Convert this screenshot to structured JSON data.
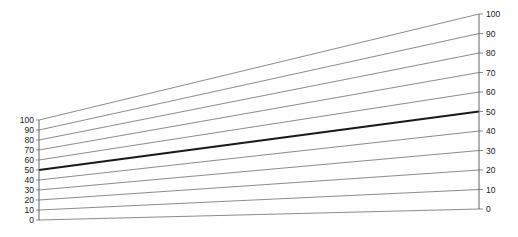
{
  "chart_data": {
    "type": "line",
    "title": "",
    "subtitle": "",
    "xlabel": "",
    "ylabel": "",
    "grid": false,
    "legend": null,
    "axes": [
      {
        "name": "left-scale",
        "position": "left",
        "range": [
          0,
          100
        ],
        "tick_step": 10,
        "tick_labels": [
          "100",
          "90",
          "80",
          "70",
          "60",
          "50",
          "40",
          "30",
          "20",
          "10",
          "0"
        ],
        "tick_values": [
          100,
          90,
          80,
          70,
          60,
          50,
          40,
          30,
          20,
          10,
          0
        ],
        "pixel_top": 120,
        "pixel_bottom": 220,
        "pixel_x": 39
      },
      {
        "name": "right-scale",
        "position": "right",
        "range": [
          0,
          100
        ],
        "tick_step": 10,
        "tick_labels": [
          "100",
          "90",
          "80",
          "70",
          "60",
          "50",
          "40",
          "30",
          "20",
          "10",
          "0"
        ],
        "tick_values": [
          100,
          90,
          80,
          70,
          60,
          50,
          40,
          30,
          20,
          10,
          0
        ],
        "pixel_top": 14,
        "pixel_bottom": 209,
        "pixel_x": 479
      }
    ],
    "series": [
      {
        "name": "tie-100",
        "value": 100,
        "left_value": 100,
        "right_value": 100,
        "emphasis": false
      },
      {
        "name": "tie-90",
        "value": 90,
        "left_value": 90,
        "right_value": 90,
        "emphasis": false
      },
      {
        "name": "tie-80",
        "value": 80,
        "left_value": 80,
        "right_value": 80,
        "emphasis": false
      },
      {
        "name": "tie-70",
        "value": 70,
        "left_value": 70,
        "right_value": 70,
        "emphasis": false
      },
      {
        "name": "tie-60",
        "value": 60,
        "left_value": 60,
        "right_value": 60,
        "emphasis": false
      },
      {
        "name": "tie-50",
        "value": 50,
        "left_value": 50,
        "right_value": 50,
        "emphasis": true
      },
      {
        "name": "tie-40",
        "value": 40,
        "left_value": 40,
        "right_value": 40,
        "emphasis": false
      },
      {
        "name": "tie-30",
        "value": 30,
        "left_value": 30,
        "right_value": 30,
        "emphasis": false
      },
      {
        "name": "tie-20",
        "value": 20,
        "left_value": 20,
        "right_value": 20,
        "emphasis": false
      },
      {
        "name": "tie-10",
        "value": 10,
        "left_value": 10,
        "right_value": 10,
        "emphasis": false
      },
      {
        "name": "tie-0",
        "value": 0,
        "left_value": 0,
        "right_value": 0,
        "emphasis": false
      }
    ],
    "colors": {
      "background": "#ffffff",
      "line": "#6e6e6e",
      "emphasis_line": "#1a1a1a",
      "axis": "#555555",
      "label": "#222222"
    }
  }
}
